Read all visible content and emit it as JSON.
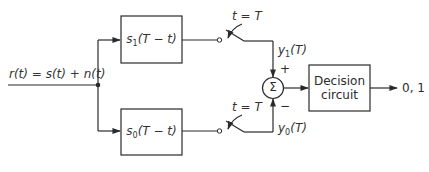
{
  "diagram": {
    "input_label": "r(t) = s(t) + n(t)",
    "filters": [
      {
        "id": "matched-filter-1",
        "label_main": "s",
        "label_sub": "1",
        "label_rest": "(T − t)"
      },
      {
        "id": "matched-filter-0",
        "label_main": "s",
        "label_sub": "0",
        "label_rest": "(T − t)"
      }
    ],
    "switches": [
      {
        "label": "t = T"
      },
      {
        "label": "t = T"
      }
    ],
    "samples": [
      {
        "main": "y",
        "sub": "1",
        "rest": "(T)"
      },
      {
        "main": "y",
        "sub": "0",
        "rest": "(T)"
      }
    ],
    "summer": {
      "symbol": "Σ",
      "plus": "+",
      "minus": "−"
    },
    "decision": {
      "line1": "Decision",
      "line2": "circuit"
    },
    "output_label": "0, 1",
    "colors": {
      "stroke": "#2a2a2a",
      "background": "#ffffff"
    }
  }
}
